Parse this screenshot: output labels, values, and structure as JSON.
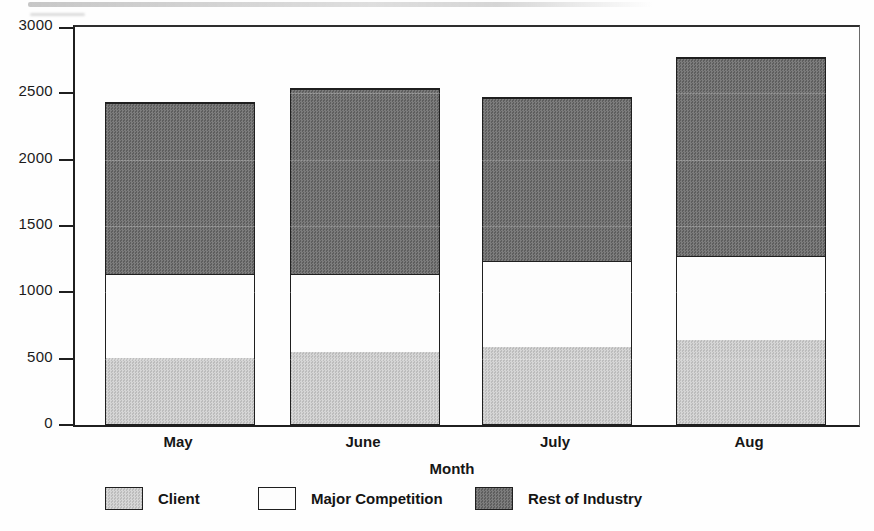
{
  "chart_data": {
    "type": "bar",
    "stacked": true,
    "title": "",
    "xlabel": "Month",
    "ylabel": "",
    "categories": [
      "May",
      "June",
      "July",
      "Aug"
    ],
    "series": [
      {
        "name": "Client",
        "values": [
          500,
          540,
          580,
          635
        ],
        "color": "#c9c9c9",
        "pattern": "halftone-light"
      },
      {
        "name": "Major Competition",
        "values": [
          635,
          590,
          650,
          630
        ],
        "color": "#ffffff",
        "pattern": "none"
      },
      {
        "name": "Rest of Industry",
        "values": [
          1290,
          1395,
          1230,
          1490
        ],
        "color": "#6e6e6e",
        "pattern": "halftone-dark"
      }
    ],
    "totals": [
      2425,
      2525,
      2460,
      2755
    ],
    "ylim": [
      0,
      3000
    ],
    "yticks": [
      0,
      500,
      1000,
      1500,
      2000,
      2500,
      3000
    ],
    "grid": false,
    "legend_position": "bottom",
    "axis_color": "#1f1f1f"
  }
}
